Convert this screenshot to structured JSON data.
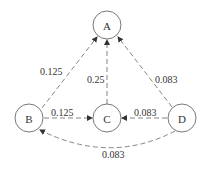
{
  "diagram": {
    "nodes": [
      {
        "id": "A",
        "label": "A",
        "cx": 107,
        "cy": 25
      },
      {
        "id": "B",
        "label": "B",
        "cx": 29,
        "cy": 118
      },
      {
        "id": "C",
        "label": "C",
        "cx": 107,
        "cy": 118
      },
      {
        "id": "D",
        "label": "D",
        "cx": 182,
        "cy": 118
      }
    ],
    "edges": [
      {
        "from": "B",
        "to": "A",
        "label": "0.125"
      },
      {
        "from": "C",
        "to": "A",
        "label": "0.25"
      },
      {
        "from": "D",
        "to": "A",
        "label": "0.083"
      },
      {
        "from": "B",
        "to": "C",
        "label": "0.125"
      },
      {
        "from": "D",
        "to": "C",
        "label": "0.083"
      },
      {
        "from": "D",
        "to": "B",
        "label": "0.083"
      }
    ]
  }
}
